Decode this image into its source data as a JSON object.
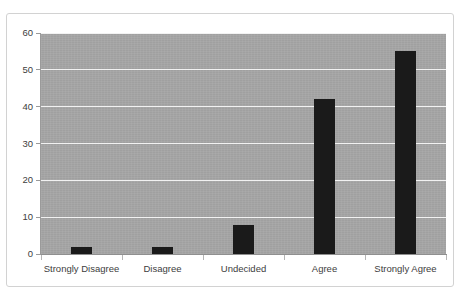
{
  "caption": {
    "text": "Figure: Respondent agreement levels reported by survey participants"
  },
  "chart_data": {
    "type": "bar",
    "title": "",
    "xlabel": "",
    "ylabel": "",
    "categories": [
      "Strongly Disagree",
      "Disagree",
      "Undecided",
      "Agree",
      "Strongly Agree"
    ],
    "values": [
      2,
      2,
      8,
      42,
      55
    ],
    "ylim": [
      0,
      60
    ],
    "ytick_labels": [
      "0",
      "10",
      "20",
      "30",
      "40",
      "50",
      "60"
    ],
    "ytick_values": [
      0,
      10,
      20,
      30,
      40,
      50,
      60
    ],
    "grid": true,
    "grid_axis": "y",
    "grid_color": "#f2f2f2",
    "legend": false,
    "legend_position": "none",
    "bar_color": "#1a1a1a",
    "plot_background": "#a6a6a6",
    "figure_background": "#ffffff",
    "border_color": "#d2d2d2"
  }
}
